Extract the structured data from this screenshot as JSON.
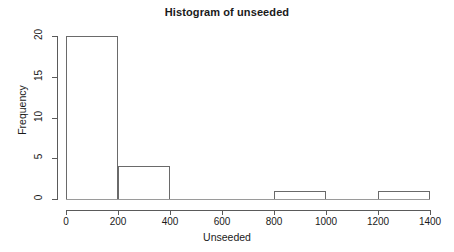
{
  "chart_data": {
    "type": "bar",
    "title": "Histogram of unseeded",
    "xlabel": "Unseeded",
    "ylabel": "Frequency",
    "xlim": [
      0,
      1400
    ],
    "ylim": [
      0,
      20
    ],
    "grid": false,
    "legend": null,
    "bin_width": 200,
    "bin_edges": [
      0,
      200,
      400,
      600,
      800,
      1000,
      1200,
      1400
    ],
    "categories": [
      "0-200",
      "200-400",
      "400-600",
      "600-800",
      "800-1000",
      "1000-1200",
      "1200-1400"
    ],
    "values": [
      20,
      4,
      0,
      0,
      1,
      0,
      1
    ],
    "bars": [
      {
        "x0": 0,
        "x1": 200,
        "freq": 20
      },
      {
        "x0": 200,
        "x1": 400,
        "freq": 4
      },
      {
        "x0": 400,
        "x1": 600,
        "freq": 0
      },
      {
        "x0": 600,
        "x1": 800,
        "freq": 0
      },
      {
        "x0": 800,
        "x1": 1000,
        "freq": 1
      },
      {
        "x0": 1000,
        "x1": 1200,
        "freq": 0
      },
      {
        "x0": 1200,
        "x1": 1400,
        "freq": 1
      }
    ],
    "x_ticks": [
      {
        "value": 0,
        "label": "0"
      },
      {
        "value": 200,
        "label": "200"
      },
      {
        "value": 400,
        "label": "400"
      },
      {
        "value": 600,
        "label": "600"
      },
      {
        "value": 800,
        "label": "800"
      },
      {
        "value": 1000,
        "label": "1000"
      },
      {
        "value": 1200,
        "label": "1200"
      },
      {
        "value": 1400,
        "label": "1400"
      }
    ],
    "y_ticks": [
      {
        "value": 0,
        "label": "0"
      },
      {
        "value": 5,
        "label": "5"
      },
      {
        "value": 10,
        "label": "10"
      },
      {
        "value": 15,
        "label": "15"
      },
      {
        "value": 20,
        "label": "20"
      }
    ],
    "colors": {
      "axis": "#5a5a5a",
      "bar_stroke": "#6a6a6a",
      "bar_fill": "transparent",
      "text": "#1a1a1a",
      "background": "#ffffff"
    }
  }
}
